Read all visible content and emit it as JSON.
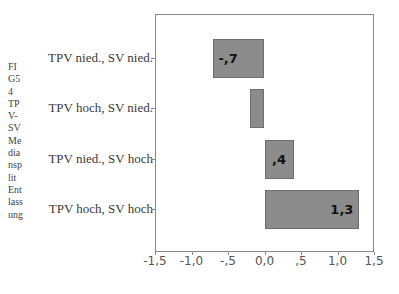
{
  "chart_data": {
    "type": "bar",
    "orientation": "horizontal",
    "title": "",
    "ylabel": "FIG54 TPV-SV Mediansplit Entlassung",
    "ylabel_lines": [
      "FI",
      "G5",
      "4",
      "TP",
      "V-",
      "SV",
      "Me",
      "dia",
      "nsp",
      "lit",
      "Ent",
      "lass",
      "ung"
    ],
    "xlabel": "",
    "categories": [
      "TPV nied., SV nied.",
      "TPV hoch, SV nied.",
      "TPV nied., SV hoch",
      "TPV hoch, SV hoch"
    ],
    "values": [
      -0.7,
      -0.2,
      0.4,
      1.3
    ],
    "data_labels": [
      ",7",
      "",
      ",4",
      "1,3"
    ],
    "data_labels_note": "first label rendered as '-,7' (negative)",
    "xlim": [
      -1.5,
      1.5
    ],
    "xticks": [
      "-1,5",
      "-1,0",
      "-,5",
      "0,0",
      ",5",
      "1,0",
      "1,5"
    ],
    "grid": false,
    "legend": null,
    "bar_color": "#8c8c8c"
  },
  "labels": {
    "bar0": "-,7",
    "bar2": ",4",
    "bar3": "1,3"
  }
}
